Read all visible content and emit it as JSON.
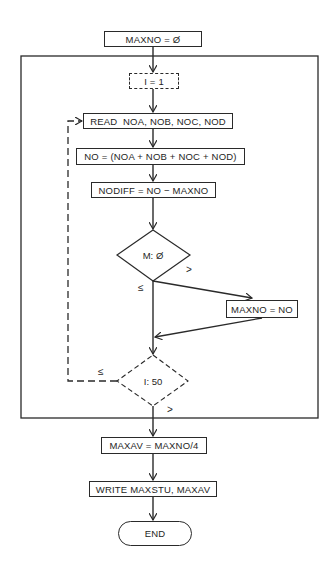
{
  "flowchart": {
    "init": "MAXNO = Ø",
    "loop_start": "I = 1",
    "read": "READ  NOA, NOB, NOC, NOD",
    "sum": "NO = (NOA + NOB + NOC + NOD)",
    "diff": "NODIFF = NO − MAXNO",
    "decision_m": "M: Ø",
    "assign_max": "MAXNO = NO",
    "decision_i": "I: 50",
    "average": "MAXAV = MAXNO/4",
    "write": "WRITE MAXSTU, MAXAV",
    "end": "END"
  },
  "edge_labels": {
    "m_gt": ">",
    "m_le": "≤",
    "i_le": "≤",
    "i_gt": ">"
  },
  "colors": {
    "line": "#2a2a2a",
    "background": "#ffffff"
  }
}
